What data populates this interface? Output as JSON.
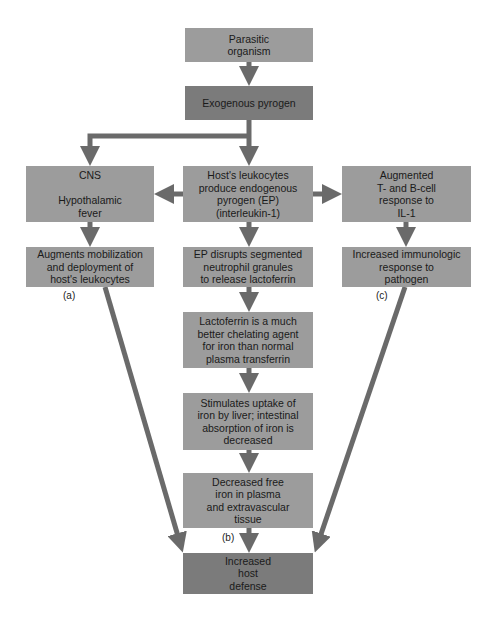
{
  "diagram": {
    "nodes": {
      "parasitic": "Parasitic\norganism",
      "exogenous": "Exogenous pyrogen",
      "cns": "CNS\n\nHypothalamic\nfever",
      "leukocytes": "Host's leukocytes\nproduce endogenous\npyrogen (EP)\n(interleukin-1)",
      "augmented": "Augmented\nT- and B-cell\nresponse to\nIL-1",
      "augments": "Augments mobilization\nand deployment of\nhost's leukocytes",
      "ep_disrupts": "EP disrupts segmented\nneutrophil granules\nto release lactoferrin",
      "immunologic": "Increased immunologic\nresponse to\npathogen",
      "lactoferrin": "Lactoferrin is a much\nbetter chelating agent\nfor iron than normal\nplasma transferrin",
      "stimulates": "Stimulates uptake of\niron by liver; intestinal\nabsorption of iron is\ndecreased",
      "decreased_iron": "Decreased free\niron in plasma\nand extravascular\ntissue",
      "host_defense": "Increased\nhost\ndefense"
    },
    "labels": {
      "a": "(a)",
      "b": "(b)",
      "c": "(c)"
    },
    "colors": {
      "box": "#9c9c9c",
      "box_dark": "#7b7b7b",
      "arrow": "#6a6a6a"
    }
  }
}
